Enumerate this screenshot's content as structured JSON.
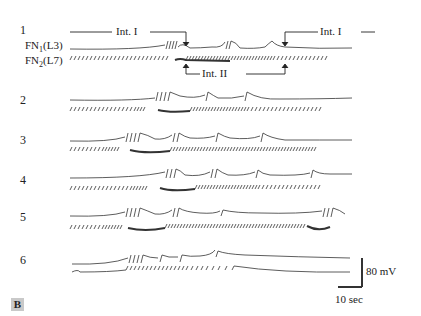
{
  "figure": {
    "panel_label": "B",
    "rows": [
      {
        "id": "1",
        "label": "1"
      },
      {
        "id": "2",
        "label": "2"
      },
      {
        "id": "3",
        "label": "3"
      },
      {
        "id": "4",
        "label": "4"
      },
      {
        "id": "5",
        "label": "5"
      },
      {
        "id": "6",
        "label": "6"
      }
    ],
    "channels": {
      "top": {
        "name": "FN",
        "sub": "1",
        "suffix": "(L3)"
      },
      "bottom": {
        "name": "FN",
        "sub": "2",
        "suffix": "(L7)"
      }
    },
    "annotations": {
      "int1_left": "Int. I",
      "int1_right": "Int. I",
      "int2": "Int. II"
    },
    "scale_bar": {
      "voltage": "80 mV",
      "time": "10 sec"
    },
    "colors": {
      "trace": "#333333",
      "panel_label_bg": "#c9c9c9"
    }
  }
}
